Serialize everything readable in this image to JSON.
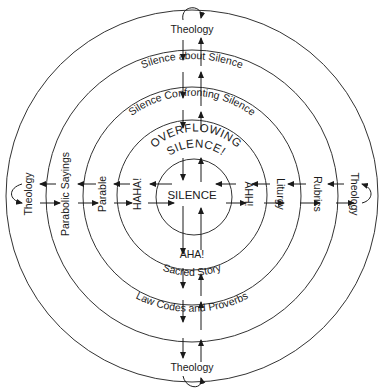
{
  "diagram": {
    "center_label": "SILENCE",
    "rings": [
      {
        "name": "ring-1",
        "top": "OVERFLOWING",
        "top2": "SILENCE!",
        "left": "HAHA!",
        "right": "AHH!",
        "bottom": "AHA!"
      },
      {
        "name": "ring-2",
        "top": "Silence Confronting Silence",
        "left": "Parable",
        "right": "Liturgy",
        "bottom": "Sacred Story"
      },
      {
        "name": "ring-3",
        "top": "Silence about Silence",
        "left": "Parabolic Sayings",
        "right": "Rubrics",
        "bottom": "Law Codes and Proverbs"
      },
      {
        "name": "ring-4",
        "top": "Theology",
        "left": "Theology",
        "right": "Theology",
        "bottom": "Theology"
      }
    ],
    "colors": {
      "line": "#1a1a1a",
      "background": "#ffffff"
    }
  }
}
